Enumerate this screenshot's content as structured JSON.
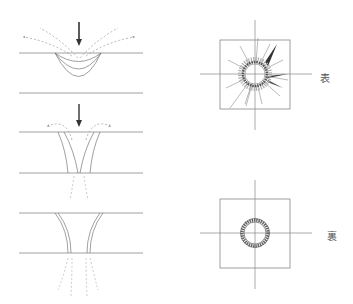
{
  "figure": {
    "cross_sections": [
      {
        "stage": 1,
        "name": "impact-dent",
        "has_arrow": true
      },
      {
        "stage": 2,
        "name": "penetration-start",
        "has_arrow": true
      },
      {
        "stage": 3,
        "name": "penetration-through",
        "has_arrow": false
      }
    ],
    "views": [
      {
        "name": "front-view",
        "label": "表"
      },
      {
        "name": "back-view",
        "label": "裏"
      }
    ],
    "colors": {
      "line": "#777777",
      "arrow": "#333333",
      "dashed": "#888888",
      "ring": "#555555"
    }
  }
}
